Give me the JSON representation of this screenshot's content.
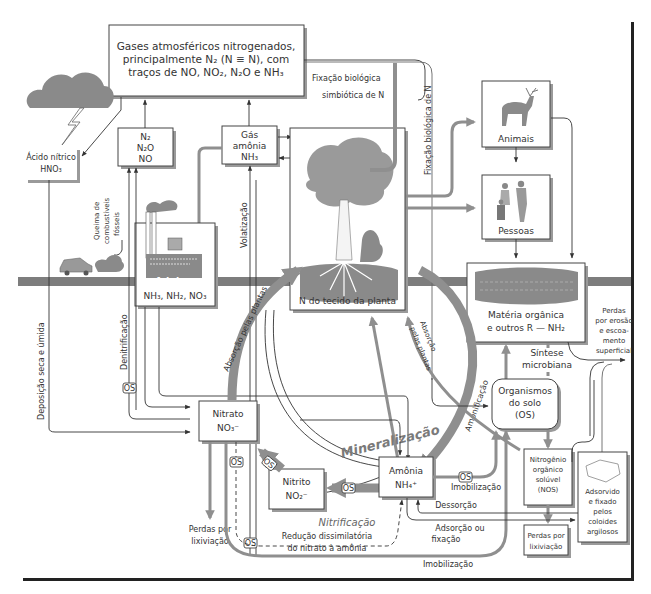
{
  "diagram": {
    "atmosphere_box": {
      "line1": "Gases atmosféricos nitrogenados,",
      "line2": "principalmente N₂ (N ≡ N), com",
      "line3": "traços de NO, NO₂, N₂O e NH₃"
    },
    "nodes": {
      "acid": {
        "line1": "Ácido nítrico",
        "line2": "HNO₃"
      },
      "n2_gases": {
        "line1": "N₂",
        "line2": "N₂O",
        "line3": "NO"
      },
      "ammonia_gas": {
        "line1": "Gás",
        "line2": "amônia",
        "line3": "NH₃"
      },
      "fertilizers": {
        "title": "Adubos",
        "formula": "NH₃, NH₂, NO₃"
      },
      "plant": {
        "label": "N do tecido da planta"
      },
      "animals": {
        "label": "Animais"
      },
      "people": {
        "label": "Pessoas"
      },
      "organic_matter": {
        "line1": "Matéria orgânica",
        "line2": "e outros R — NH₂"
      },
      "soil_organisms": {
        "line1": "Organismos",
        "line2": "do solo",
        "line3": "(OS)"
      },
      "nitrate": {
        "line1": "Nitrato",
        "line2": "NO₃⁻"
      },
      "nitrite": {
        "line1": "Nitrito",
        "line2": "NO₂⁻"
      },
      "ammonium": {
        "line1": "Amônia",
        "line2": "NH₄⁺"
      },
      "nos": {
        "line1": "Nitrogênio",
        "line2": "orgânico",
        "line3": "solúvel",
        "line4": "(NOS)"
      },
      "clay": {
        "line1": "Adsorvido",
        "line2": "e fixado",
        "line3": "pelos",
        "line4": "coloides",
        "line5": "argilosos"
      },
      "leach_left": {
        "line1": "Perdas por",
        "line2": "lixiviação"
      },
      "leach_right": {
        "line1": "Perdas por",
        "line2": "lixiviação"
      }
    },
    "process_labels": {
      "fixation_symbiotic_1": "Fixação biológica",
      "fixation_symbiotic_2": "simbiótica de N",
      "fixation_biological": "Fixação biológica de N",
      "fossil_1": "Queima de",
      "fossil_2": "combustíveis",
      "fossil_3": "fósseis",
      "volatilization": "Volatização",
      "deposition": "Deposição seca e úmida",
      "denitrification": "Denitrificação",
      "plant_uptake_left": "Absorção pelas plantas",
      "plant_uptake_right_1": "Absorção",
      "plant_uptake_right_2": "pelas plantas",
      "ammonification": "Amonificação",
      "microbial_synthesis_1": "Síntese",
      "microbial_synthesis_2": "microbiana",
      "erosion_1": "Perdas",
      "erosion_2": "por erosão",
      "erosion_3": "e escoa-",
      "erosion_4": "mento",
      "erosion_5": "superficial",
      "mineralization": "Mineralização",
      "immobilization_1": "Imobilização",
      "immobilization_2": "Imobilização",
      "desorption": "Dessorção",
      "adsorption_1": "Adsorção ou",
      "adsorption_2": "fixação",
      "nitrification": "Nitrificação",
      "dnra_1": "Redução dissimilatória",
      "dnra_2": "do nitrato à amônia",
      "os": "OS"
    },
    "colors": {
      "flow_gray": "#8f8f8f",
      "soil_band": "#7d7d7d",
      "line_dark": "#333333",
      "box_border": "#444444"
    }
  }
}
